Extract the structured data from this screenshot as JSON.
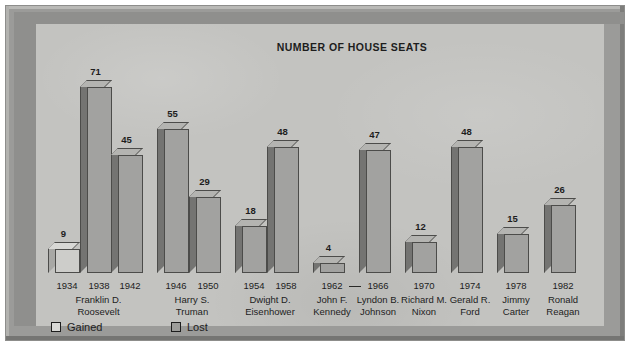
{
  "chart_data": {
    "type": "bar",
    "title": "NUMBER OF HOUSE SEATS",
    "xlabel": "",
    "ylabel": "",
    "grid": false,
    "legend_position": "bottom-left",
    "ylim": [
      0,
      71
    ],
    "legend": [
      {
        "key": "gained",
        "label": "Gained",
        "swatch": "#d9d9d6"
      },
      {
        "key": "lost",
        "label": "Lost",
        "swatch": "#9d9d9a"
      }
    ],
    "categories": [
      "1934",
      "1938",
      "1942",
      "1946",
      "1950",
      "1954",
      "1958",
      "1962",
      "1966",
      "1970",
      "1974",
      "1978",
      "1982"
    ],
    "values": [
      9,
      71,
      45,
      55,
      29,
      18,
      48,
      4,
      47,
      12,
      48,
      15,
      26
    ],
    "points": [
      {
        "year": "1934",
        "value": 9,
        "result": "gained",
        "president": "Franklin D. Roosevelt"
      },
      {
        "year": "1938",
        "value": 71,
        "result": "lost",
        "president": "Franklin D. Roosevelt"
      },
      {
        "year": "1942",
        "value": 45,
        "result": "lost",
        "president": "Franklin D. Roosevelt"
      },
      {
        "year": "1946",
        "value": 55,
        "result": "lost",
        "president": "Harry S. Truman"
      },
      {
        "year": "1950",
        "value": 29,
        "result": "lost",
        "president": "Harry S. Truman"
      },
      {
        "year": "1954",
        "value": 18,
        "result": "lost",
        "president": "Dwight D. Eisenhower"
      },
      {
        "year": "1958",
        "value": 48,
        "result": "lost",
        "president": "Dwight D. Eisenhower"
      },
      {
        "year": "1962",
        "value": 4,
        "result": "lost",
        "president": "John F. Kennedy"
      },
      {
        "year": "1966",
        "value": 47,
        "result": "lost",
        "president": "Lyndon B. Johnson"
      },
      {
        "year": "1970",
        "value": 12,
        "result": "lost",
        "president": "Richard M. Nixon"
      },
      {
        "year": "1974",
        "value": 48,
        "result": "lost",
        "president": "Gerald R. Ford"
      },
      {
        "year": "1978",
        "value": 15,
        "result": "lost",
        "president": "Jimmy Carter"
      },
      {
        "year": "1982",
        "value": 26,
        "result": "lost",
        "president": "Ronald Reagan"
      }
    ],
    "presidents": [
      {
        "name_line1": "Franklin D.",
        "name_line2": "Roosevelt",
        "years": [
          "1934",
          "1938",
          "1942"
        ]
      },
      {
        "name_line1": "Harry S.",
        "name_line2": "Truman",
        "years": [
          "1946",
          "1950"
        ]
      },
      {
        "name_line1": "Dwight D.",
        "name_line2": "Eisenhower",
        "years": [
          "1954",
          "1958"
        ]
      },
      {
        "name_line1": "John F.",
        "name_line2": "Kennedy",
        "years": [
          "1962"
        ]
      },
      {
        "name_line1": "Lyndon B.",
        "name_line2": "Johnson",
        "years": [
          "1966"
        ]
      },
      {
        "name_line1": "Richard M.",
        "name_line2": "Nixon",
        "years": [
          "1970"
        ]
      },
      {
        "name_line1": "Gerald R.",
        "name_line2": "Ford",
        "years": [
          "1974"
        ]
      },
      {
        "name_line1": "Jimmy",
        "name_line2": "Carter",
        "years": [
          "1978"
        ]
      },
      {
        "name_line1": "Ronald",
        "name_line2": "Reagan",
        "years": [
          "1982"
        ]
      }
    ],
    "annotations": [
      {
        "type": "term-dash",
        "between": [
          "1962",
          "1966"
        ],
        "note": "dash linking Kennedy and Johnson terms"
      }
    ]
  },
  "colors": {
    "paper": "#c3c3c0",
    "frame": "#9b9b99",
    "bar_lost": "#a2a2a0",
    "bar_gained": "#cdcdca",
    "bar_side": "#747472",
    "bar_top": "#b4b4b1",
    "ink": "#1d1d1d"
  }
}
